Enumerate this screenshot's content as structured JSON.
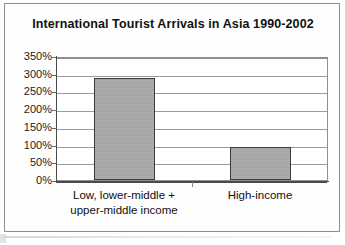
{
  "chart_data": {
    "type": "bar",
    "title": "International Tourist Arrivals in Asia 1990-2002",
    "xlabel": "",
    "ylabel": "",
    "categories": [
      "Low, lower-middle + upper-middle income",
      "High-income"
    ],
    "category_lines": [
      [
        "Low, lower-middle +",
        "upper-middle income"
      ],
      [
        "High-income"
      ]
    ],
    "values": [
      287,
      93
    ],
    "value_unit": "%",
    "ylim": [
      0,
      350
    ],
    "ytick_values": [
      0,
      50,
      100,
      150,
      200,
      250,
      300,
      350
    ],
    "ytick_labels": [
      "0%",
      "50%",
      "100%",
      "150%",
      "200%",
      "250%",
      "300%",
      "350%"
    ],
    "grid": true,
    "legend": false,
    "bar_color": "#a9a9a9",
    "bar_border_color": "#3c3c3c",
    "gridline_color": "#9a9a9a",
    "axis_color": "#4a4a4a",
    "frame_color": "#8d8d8d",
    "text_color": "#121212"
  }
}
